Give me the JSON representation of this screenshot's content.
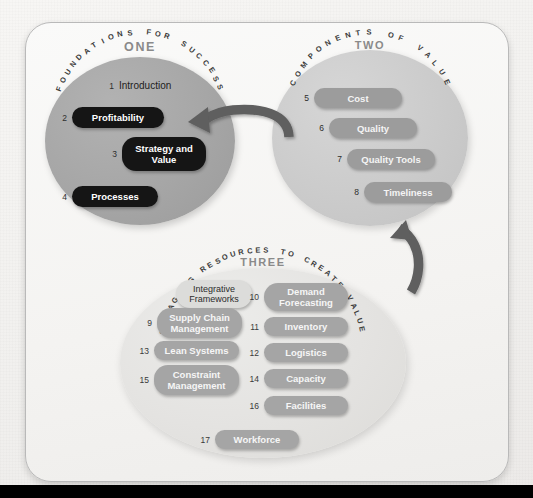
{
  "diagram": {
    "title_hidden": "",
    "sections": [
      {
        "id": "one",
        "arc_label": "FOUNDATIONS FOR SUCCESS",
        "number_label": "ONE",
        "items": [
          {
            "num": "1",
            "label": "Introduction",
            "style": "plain"
          },
          {
            "num": "2",
            "label": "Profitability",
            "style": "dark"
          },
          {
            "num": "3",
            "label": "Strategy and Value",
            "style": "dark"
          },
          {
            "num": "4",
            "label": "Processes",
            "style": "dark"
          }
        ]
      },
      {
        "id": "two",
        "arc_label": "COMPONENTS OF VALUE",
        "number_label": "TWO",
        "items": [
          {
            "num": "5",
            "label": "Cost",
            "style": "mid"
          },
          {
            "num": "6",
            "label": "Quality",
            "style": "mid"
          },
          {
            "num": "7",
            "label": "Quality Tools",
            "style": "mid"
          },
          {
            "num": "8",
            "label": "Timeliness",
            "style": "mid"
          }
        ]
      },
      {
        "id": "three",
        "arc_label": "MANAGING RESOURCES TO CREATE VALUE",
        "number_label": "THREE",
        "items_left": [
          {
            "num": "",
            "label": "Integrative Frameworks",
            "style": "light"
          },
          {
            "num": "9",
            "label": "Supply Chain Management",
            "style": "mid"
          },
          {
            "num": "13",
            "label": "Lean Systems",
            "style": "mid"
          },
          {
            "num": "15",
            "label": "Constraint Management",
            "style": "mid"
          }
        ],
        "items_right": [
          {
            "num": "10",
            "label": "Demand Forecasting",
            "style": "mid"
          },
          {
            "num": "11",
            "label": "Inventory",
            "style": "mid"
          },
          {
            "num": "12",
            "label": "Logistics",
            "style": "mid"
          },
          {
            "num": "14",
            "label": "Capacity",
            "style": "mid"
          },
          {
            "num": "16",
            "label": "Facilities",
            "style": "mid"
          }
        ],
        "items_bottom": [
          {
            "num": "17",
            "label": "Workforce",
            "style": "mid"
          }
        ]
      }
    ],
    "arrows": [
      {
        "name": "arrow-two-to-one",
        "from": "two",
        "to": "one"
      },
      {
        "name": "arrow-three-to-two",
        "from": "three",
        "to": "two"
      }
    ],
    "colors": {
      "circle_one": "#a6a6a6",
      "circle_two": "#cbcbcb",
      "circle_three": "#e4e3e1",
      "pill_dark": "#151515",
      "pill_mid": "#9c9c9c",
      "pill_light": "#dcdcda",
      "arrow": "#5a5a5a",
      "page_bg": "#f4f3f1",
      "bottom_bar": "#000000"
    }
  }
}
